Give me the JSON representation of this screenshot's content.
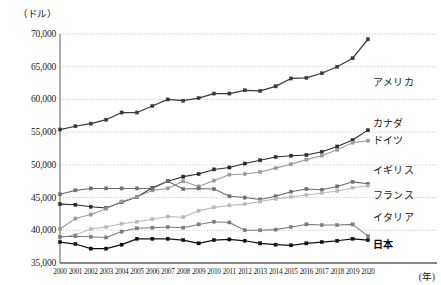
{
  "chart_data": {
    "type": "line",
    "title": "",
    "xlabel": "(年)",
    "ylabel": "（ドル）",
    "ylim": [
      35000,
      70000
    ],
    "xlim": [
      2000,
      2020
    ],
    "grid": true,
    "legend_position": "right-inline",
    "yticks": [
      70000,
      65000,
      60000,
      55000,
      50000,
      45000,
      40000,
      35000
    ],
    "ytick_labels": [
      "70,000",
      "65,000",
      "60,000",
      "55,000",
      "50,000",
      "45,000",
      "40,000",
      "35,000"
    ],
    "x": [
      2000,
      2001,
      2002,
      2003,
      2004,
      2005,
      2006,
      2007,
      2008,
      2009,
      2010,
      2011,
      2012,
      2013,
      2014,
      2015,
      2016,
      2017,
      2018,
      2019,
      2020
    ],
    "categories": [
      "2000",
      "2001",
      "2002",
      "2003",
      "2004",
      "2005",
      "2006",
      "2007",
      "2008",
      "2009",
      "2010",
      "2011",
      "2012",
      "2013",
      "2014",
      "2015",
      "2016",
      "2017",
      "2018",
      "2019",
      "2020"
    ],
    "series": [
      {
        "name": "アメリカ",
        "color": "#3a3a3a",
        "label_y": 62800,
        "values": [
          55400,
          55900,
          56300,
          56900,
          58000,
          58000,
          59000,
          60000,
          59800,
          60200,
          60900,
          60900,
          61400,
          61300,
          62000,
          63200,
          63300,
          64000,
          65000,
          66300,
          69200
        ]
      },
      {
        "name": "カナダ",
        "color": "#2b2b2b",
        "label_y": 56500,
        "values": [
          44000,
          43900,
          43600,
          43400,
          44300,
          45100,
          46500,
          47500,
          48200,
          48600,
          49300,
          49600,
          50200,
          50700,
          51200,
          51400,
          51500,
          52000,
          52800,
          53800,
          55300
        ]
      },
      {
        "name": "ドイツ",
        "color": "#9a9a9a",
        "label_y": 54000,
        "values": [
          40200,
          41800,
          42400,
          43300,
          44400,
          45100,
          46100,
          46400,
          47500,
          46700,
          47600,
          48500,
          48600,
          48900,
          49500,
          50100,
          50800,
          51400,
          52300,
          53400,
          53700
        ]
      },
      {
        "name": "イギリス",
        "color": "#6e6e6e",
        "label_y": 49400,
        "values": [
          45500,
          46100,
          46400,
          46400,
          46400,
          46400,
          46400,
          47500,
          46300,
          46400,
          46300,
          45200,
          45000,
          44700,
          45200,
          45900,
          46300,
          46200,
          46700,
          47400,
          47100
        ]
      },
      {
        "name": "フランス",
        "color": "#b8b8b8",
        "label_y": 45500,
        "values": [
          38900,
          39300,
          40200,
          40500,
          41000,
          41300,
          41700,
          42100,
          42000,
          43000,
          43500,
          43800,
          44000,
          44400,
          44800,
          45100,
          45400,
          45700,
          46000,
          46500,
          46800
        ]
      },
      {
        "name": "イタリア",
        "color": "#7c7c7c",
        "label_y": 42200,
        "values": [
          39000,
          39100,
          39000,
          38900,
          39800,
          40300,
          40400,
          40500,
          40400,
          40900,
          41300,
          41200,
          40000,
          40000,
          40100,
          40500,
          40900,
          40800,
          40800,
          40900,
          39100
        ]
      },
      {
        "name": "日本",
        "color": "#111111",
        "label_y": 38000,
        "values": [
          38200,
          37900,
          37200,
          37200,
          37800,
          38700,
          38700,
          38700,
          38500,
          38000,
          38500,
          38600,
          38400,
          38000,
          37800,
          37700,
          38000,
          38200,
          38400,
          38700,
          38500
        ]
      }
    ]
  }
}
